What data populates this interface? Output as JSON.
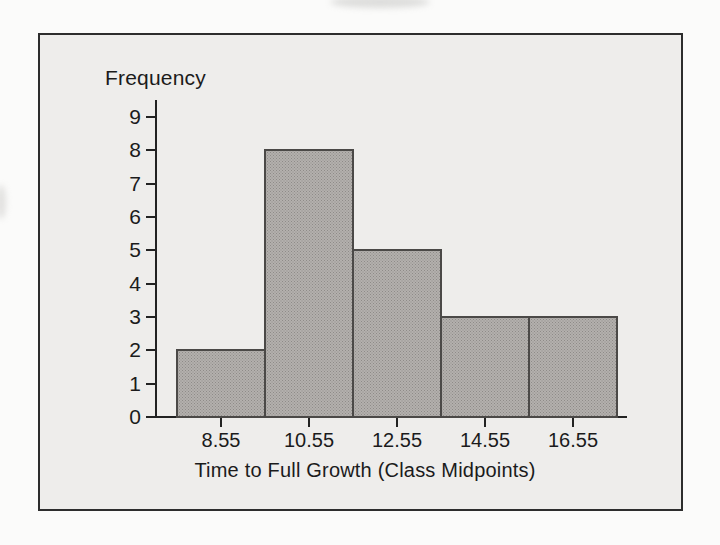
{
  "figure": {
    "page_bg": "#fbfbfa",
    "frame_bg": "#eeedeb",
    "frame_border": "#2d2d2d",
    "text_color": "#1b1b1b"
  },
  "chart_data": {
    "type": "bar",
    "title": "",
    "ylabel": "Frequency",
    "xlabel": "Time to Full Growth (Class Midpoints)",
    "categories": [
      "8.55",
      "10.55",
      "12.55",
      "14.55",
      "16.55"
    ],
    "values": [
      2,
      8,
      5,
      3,
      3
    ],
    "ylim": [
      0,
      9
    ],
    "yticks": [
      0,
      1,
      2,
      3,
      4,
      5,
      6,
      7,
      8,
      9
    ],
    "grid": false,
    "legend": "none",
    "bars_contiguous": true,
    "bar_fill": "#b3b0ad",
    "bar_dot": "#8e8b88",
    "bar_border": "#4b4947",
    "axis_color": "#222222"
  }
}
